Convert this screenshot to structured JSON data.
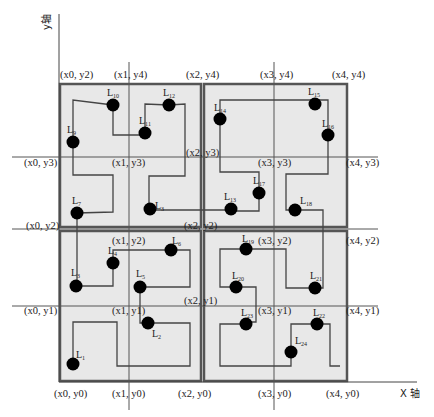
{
  "axes": {
    "x_label": "X 轴",
    "y_label": "y轴"
  },
  "colors": {
    "quadrant_fill": "#e8e8e8",
    "quadrant_border": "#555555",
    "grid_line": "#555555",
    "path": "#444444",
    "node": "#000000",
    "background": "#ffffff"
  },
  "coordinate_labels": [
    {
      "id": "x0y2_top",
      "text": "(x0, y2)",
      "x": 60,
      "y": 78
    },
    {
      "id": "x1y4",
      "text": "(x1, y4)",
      "x": 114,
      "y": 78
    },
    {
      "id": "x2y4",
      "text": "(x2, y4)",
      "x": 186,
      "y": 78
    },
    {
      "id": "x3y4",
      "text": "(x3, y4)",
      "x": 260,
      "y": 78
    },
    {
      "id": "x4y4",
      "text": "(x4, y4)",
      "x": 332,
      "y": 78
    },
    {
      "id": "x2y3",
      "text": "(x2, y3)",
      "x": 186,
      "y": 156
    },
    {
      "id": "x0y3",
      "text": "(x0, y3)",
      "x": 24,
      "y": 166
    },
    {
      "id": "x1y3",
      "text": "(x1, y3)",
      "x": 112,
      "y": 166
    },
    {
      "id": "x3y3",
      "text": "(x3, y3)",
      "x": 258,
      "y": 166
    },
    {
      "id": "x4y3",
      "text": "(x4, y3)",
      "x": 346,
      "y": 166
    },
    {
      "id": "x0y2",
      "text": "(x0, y2)",
      "x": 26,
      "y": 229
    },
    {
      "id": "x2y2",
      "text": "(x2, y2)",
      "x": 184,
      "y": 229
    },
    {
      "id": "x1y2",
      "text": "(x1, y2)",
      "x": 112,
      "y": 244
    },
    {
      "id": "x3y2",
      "text": "(x3, y2)",
      "x": 258,
      "y": 244
    },
    {
      "id": "x4y2",
      "text": "(x4, y2)",
      "x": 346,
      "y": 244
    },
    {
      "id": "x2y1",
      "text": "(x2, y1)",
      "x": 184,
      "y": 304
    },
    {
      "id": "x0y1",
      "text": "(x0, y1)",
      "x": 24,
      "y": 314
    },
    {
      "id": "x1y1",
      "text": "(x1, y1)",
      "x": 112,
      "y": 314
    },
    {
      "id": "x3y1",
      "text": "(x3, y1)",
      "x": 258,
      "y": 314
    },
    {
      "id": "x4y1",
      "text": "(x4, y1)",
      "x": 346,
      "y": 314
    },
    {
      "id": "x0y0",
      "text": "(x0, y0)",
      "x": 54,
      "y": 397
    },
    {
      "id": "x1y0",
      "text": "(x1, y0)",
      "x": 112,
      "y": 397
    },
    {
      "id": "x2y0",
      "text": "(x2, y0)",
      "x": 178,
      "y": 397
    },
    {
      "id": "x3y0",
      "text": "(x3, y0)",
      "x": 258,
      "y": 397
    },
    {
      "id": "x4y0",
      "text": "(x4, y0)",
      "x": 326,
      "y": 397
    }
  ],
  "nodes": [
    {
      "id": "L1",
      "base": "L",
      "sub": "1",
      "cx": 73,
      "cy": 364,
      "lx": 76,
      "ly": 358
    },
    {
      "id": "L2",
      "base": "L",
      "sub": "2",
      "cx": 148,
      "cy": 323,
      "lx": 152,
      "ly": 337
    },
    {
      "id": "L3",
      "base": "L",
      "sub": "3",
      "cx": 76,
      "cy": 286,
      "lx": 71,
      "ly": 276
    },
    {
      "id": "L4",
      "base": "L",
      "sub": "4",
      "cx": 113,
      "cy": 263,
      "lx": 108,
      "ly": 254
    },
    {
      "id": "L5",
      "base": "L",
      "sub": "5",
      "cx": 140,
      "cy": 287,
      "lx": 136,
      "ly": 277
    },
    {
      "id": "L6",
      "base": "L",
      "sub": "6",
      "cx": 171,
      "cy": 250,
      "lx": 172,
      "ly": 244
    },
    {
      "id": "L7",
      "base": "L",
      "sub": "7",
      "cx": 77,
      "cy": 213,
      "lx": 72,
      "ly": 204
    },
    {
      "id": "L8",
      "base": "L",
      "sub": "3",
      "cx": 150,
      "cy": 209,
      "lx": 155,
      "ly": 209
    },
    {
      "id": "L9",
      "base": "L",
      "sub": "9",
      "cx": 73,
      "cy": 142,
      "lx": 67,
      "ly": 133
    },
    {
      "id": "L10",
      "base": "L",
      "sub": "10",
      "cx": 113,
      "cy": 105,
      "lx": 107,
      "ly": 96
    },
    {
      "id": "L11",
      "base": "L",
      "sub": "11",
      "cx": 145,
      "cy": 133,
      "lx": 139,
      "ly": 124
    },
    {
      "id": "L12",
      "base": "L",
      "sub": "12",
      "cx": 169,
      "cy": 105,
      "lx": 163,
      "ly": 96
    },
    {
      "id": "L13",
      "base": "L",
      "sub": "13",
      "cx": 231,
      "cy": 209,
      "lx": 224,
      "ly": 200
    },
    {
      "id": "L14",
      "base": "L",
      "sub": "14",
      "cx": 220,
      "cy": 119,
      "lx": 214,
      "ly": 111
    },
    {
      "id": "L15",
      "base": "L",
      "sub": "15",
      "cx": 315,
      "cy": 104,
      "lx": 308,
      "ly": 95
    },
    {
      "id": "L16",
      "base": "L",
      "sub": "16",
      "cx": 328,
      "cy": 135,
      "lx": 322,
      "ly": 127
    },
    {
      "id": "L17",
      "base": "L",
      "sub": "17",
      "cx": 259,
      "cy": 193,
      "lx": 253,
      "ly": 184
    },
    {
      "id": "L18",
      "base": "L",
      "sub": "18",
      "cx": 295,
      "cy": 210,
      "lx": 300,
      "ly": 204
    },
    {
      "id": "L19",
      "base": "L",
      "sub": "19",
      "cx": 246,
      "cy": 249,
      "lx": 242,
      "ly": 242
    },
    {
      "id": "L20",
      "base": "L",
      "sub": "20",
      "cx": 236,
      "cy": 287,
      "lx": 232,
      "ly": 279
    },
    {
      "id": "L21",
      "base": "L",
      "sub": "21",
      "cx": 315,
      "cy": 288,
      "lx": 310,
      "ly": 279
    },
    {
      "id": "L22",
      "base": "L",
      "sub": "22",
      "cx": 317,
      "cy": 324,
      "lx": 313,
      "ly": 316
    },
    {
      "id": "L23",
      "base": "L",
      "sub": "23",
      "cx": 246,
      "cy": 324,
      "lx": 241,
      "ly": 316
    },
    {
      "id": "L24",
      "base": "L",
      "sub": "24",
      "cx": 291,
      "cy": 352,
      "lx": 295,
      "ly": 344
    }
  ]
}
